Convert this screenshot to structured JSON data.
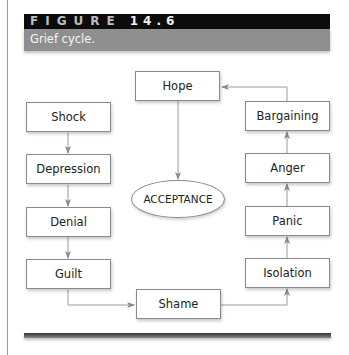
{
  "figure": {
    "label_word": "FIGURE",
    "label_number": "14.6",
    "caption": "Grief cycle."
  },
  "diagram": {
    "title": "Grief cycle",
    "center": "ACCEPTANCE",
    "nodes": {
      "shock": "Shock",
      "depression": "Depression",
      "denial": "Denial",
      "guilt": "Guilt",
      "shame": "Shame",
      "isolation": "Isolation",
      "panic": "Panic",
      "anger": "Anger",
      "bargaining": "Bargaining",
      "hope": "Hope"
    },
    "flow": [
      "Shock",
      "Depression",
      "Denial",
      "Guilt",
      "Shame",
      "Isolation",
      "Panic",
      "Anger",
      "Bargaining",
      "Hope",
      "ACCEPTANCE"
    ],
    "colors": {
      "header_black": "#0c0c0c",
      "header_gray": "#8f8f8f",
      "box_border": "#8a8a8a",
      "arrow": "#8a8a8a"
    }
  }
}
